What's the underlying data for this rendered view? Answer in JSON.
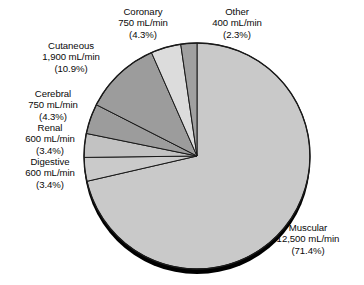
{
  "chart_data": {
    "type": "pie",
    "title": "",
    "subtitle": "",
    "xlabel": "",
    "ylabel": "",
    "legend_position": "none",
    "grid": false,
    "unit": "mL/min",
    "total_value": 17500,
    "categories": [
      "Muscular",
      "Cutaneous",
      "Coronary",
      "Cerebral",
      "Renal",
      "Digestive",
      "Other"
    ],
    "values": [
      12500,
      1900,
      750,
      750,
      600,
      600,
      400
    ],
    "percents": [
      71.4,
      10.9,
      4.3,
      4.3,
      3.4,
      3.4,
      2.3
    ],
    "slices": [
      {
        "name": "Muscular",
        "value": 12500,
        "value_text": "12,500 mL/min",
        "percent": 71.4,
        "percent_text": "(71.4%)",
        "color": "#c9c9c9",
        "start_angle": 0,
        "end_angle": 257.04
      },
      {
        "name": "Digestive",
        "value": 600,
        "value_text": "600 mL/min",
        "percent": 3.4,
        "percent_text": "(3.4%)",
        "color": "#cacaca",
        "start_angle": 257.04,
        "end_angle": 269.28
      },
      {
        "name": "Renal",
        "value": 600,
        "value_text": "600 mL/min",
        "percent": 3.4,
        "percent_text": "(3.4%)",
        "color": "#c2c2c2",
        "start_angle": 269.28,
        "end_angle": 281.52
      },
      {
        "name": "Cerebral",
        "value": 750,
        "value_text": "750 mL/min",
        "percent": 4.3,
        "percent_text": "(4.3%)",
        "color": "#9c9c9c",
        "start_angle": 281.52,
        "end_angle": 297.0
      },
      {
        "name": "Cutaneous",
        "value": 1900,
        "value_text": "1,900 mL/min",
        "percent": 10.9,
        "percent_text": "(10.9%)",
        "color": "#9c9c9c",
        "start_angle": 297.0,
        "end_angle": 336.24
      },
      {
        "name": "Coronary",
        "value": 750,
        "value_text": "750 mL/min",
        "percent": 4.3,
        "percent_text": "(4.3%)",
        "color": "#dcdcdc",
        "start_angle": 336.24,
        "end_angle": 351.72
      },
      {
        "name": "Other",
        "value": 400,
        "value_text": "400 mL/min",
        "percent": 2.3,
        "percent_text": "(2.3%)",
        "color": "#a0a0a0",
        "start_angle": 351.72,
        "end_angle": 360
      }
    ],
    "geometry": {
      "center_x": 197,
      "center_y": 156,
      "radius": 113,
      "shadow_offset_y": 5,
      "shadow_color": "#000000",
      "outline_color": "#1a1a1a"
    }
  },
  "labels": {
    "coronary": {
      "name": "Coronary",
      "value": "750 mL/min",
      "percent": "(4.3%)"
    },
    "other": {
      "name": "Other",
      "value": "400 mL/min",
      "percent": "(2.3%)"
    },
    "cutaneous": {
      "name": "Cutaneous",
      "value": "1,900 mL/min",
      "percent": "(10.9%)"
    },
    "cerebral": {
      "name": "Cerebral",
      "value": "750 mL/min",
      "percent": "(4.3%)"
    },
    "renal": {
      "name": "Renal",
      "value": "600 mL/min",
      "percent": "(3.4%)"
    },
    "digestive": {
      "name": "Digestive",
      "value": "600 mL/min",
      "percent": "(3.4%)"
    },
    "muscular": {
      "name": "Muscular",
      "value": "12,500 mL/min",
      "percent": "(71.4%)"
    }
  }
}
